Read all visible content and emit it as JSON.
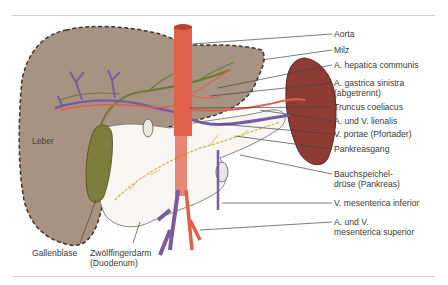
{
  "figure": {
    "colors": {
      "liver": "#a89383",
      "liver_outline": "#3c3430",
      "spleen": "#8e3b34",
      "gallbladder": "#7d7d3c",
      "artery": "#e0604a",
      "vein": "#7a5aa0",
      "bile": "#6b7a34",
      "pancreas_duct": "#d9b24a",
      "rule": "#cfcfcf",
      "text": "#3a3a3a"
    },
    "organ_labels": {
      "liver": "Leber"
    },
    "right_labels": [
      {
        "id": "aorta",
        "text": "Aorta"
      },
      {
        "id": "milz",
        "text": "Milz"
      },
      {
        "id": "hepatica",
        "text": "A. hepatica communis"
      },
      {
        "id": "gastrica",
        "text": "A. gastrica sinistra\n(abgetrennt)"
      },
      {
        "id": "truncus",
        "text": "Truncus coeliacus"
      },
      {
        "id": "lienalis",
        "text": "A. und V. lienalis"
      },
      {
        "id": "portae",
        "text": "V. portae (Pfortader)"
      },
      {
        "id": "pankreasgang",
        "text": "Pankreasgang"
      },
      {
        "id": "pankreas",
        "text": "Bauchspeichel-\ndrüse (Pankreas)"
      },
      {
        "id": "mes_inf",
        "text": "V. mesenterica inferior"
      },
      {
        "id": "mes_sup",
        "text": "A. und V.\nmesenterica superior"
      }
    ],
    "bottom_labels": [
      {
        "id": "gallenblase",
        "text": "Gallenblase"
      },
      {
        "id": "duodenum",
        "text": "Zwölffingerdarm\n(Duodenum)"
      }
    ]
  }
}
